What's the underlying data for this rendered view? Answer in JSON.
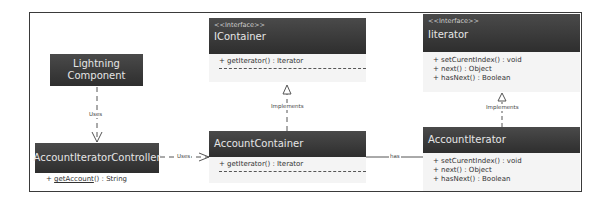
{
  "diagram": {
    "type": "uml-class-diagram",
    "nodes": {
      "lightning_component": {
        "label_line1": "Lightning",
        "label_line2": "Component"
      },
      "controller": {
        "title": "AccountIteratorController",
        "methods": [
          {
            "visibility": "+",
            "name": "getAccount",
            "suffix": "() : String"
          }
        ]
      },
      "icontainer": {
        "stereotype": "<<Interface>>",
        "title": "IContainer",
        "methods": [
          "+ getIterator() : Iterator"
        ]
      },
      "account_container": {
        "title": "AccountContainer",
        "methods": [
          "+ getIterator() : Iterator"
        ]
      },
      "iiterator": {
        "stereotype": "<<Interface>>",
        "title": "Iiterator",
        "methods": [
          "+ setCurentIndex() : void",
          "+ next() : Object",
          "+ hasNext() : Boolean"
        ]
      },
      "account_iterator": {
        "title": "AccountIterator",
        "methods": [
          "+ setCurentIndex() : void",
          "+ next() : Object",
          "+ hasNext() : Boolean"
        ]
      }
    },
    "edges": {
      "lc_to_controller": {
        "label": "Uses",
        "style": "dashed",
        "arrow": "open"
      },
      "controller_to_container": {
        "label": "Uses",
        "style": "dashed",
        "arrow": "open"
      },
      "container_implements": {
        "label": "Implements",
        "style": "dashed",
        "arrow": "hollow-triangle"
      },
      "container_has_iterator": {
        "label": "has",
        "style": "solid",
        "arrow": "none"
      },
      "iterator_implements": {
        "label": "Implements",
        "style": "dashed",
        "arrow": "hollow-triangle"
      }
    },
    "colors": {
      "header_dark": "#333333",
      "body_light": "#f4f4f4",
      "frame": "#3a3a3a"
    }
  }
}
